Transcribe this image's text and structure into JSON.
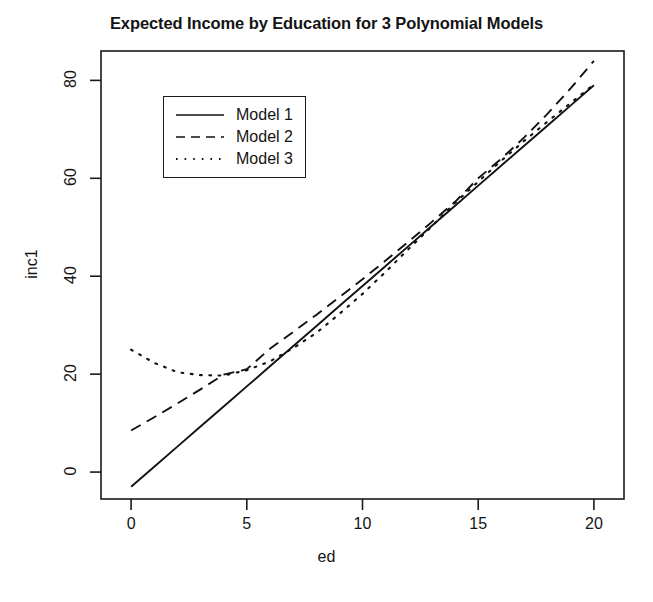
{
  "chart_data": {
    "type": "line",
    "title": "Expected Income by Education for 3 Polynomial Models",
    "xlabel": "ed",
    "ylabel": "inc1",
    "xlim": [
      -1.3,
      21.3
    ],
    "ylim": [
      -5.5,
      86.0
    ],
    "grid": false,
    "legend_position": "top-left-inside",
    "xticks": [
      0,
      5,
      10,
      15,
      20
    ],
    "xtick_labels": [
      "0",
      "5",
      "10",
      "15",
      "20"
    ],
    "yticks": [
      0,
      20,
      40,
      60,
      80
    ],
    "ytick_labels": [
      "0",
      "20",
      "40",
      "60",
      "80"
    ],
    "x": [
      0,
      1,
      2,
      3,
      4,
      5,
      6,
      7,
      8,
      9,
      10,
      11,
      12,
      13,
      14,
      15,
      16,
      17,
      18,
      19,
      20
    ],
    "series": [
      {
        "name": "Model 1",
        "linestyle": "solid",
        "color": "#111111",
        "values": [
          -3.0,
          1.1,
          5.2,
          9.3,
          13.4,
          17.5,
          21.6,
          25.7,
          29.8,
          33.9,
          38.0,
          42.1,
          46.2,
          50.3,
          54.4,
          58.5,
          62.6,
          66.7,
          70.8,
          74.9,
          79.0
        ]
      },
      {
        "name": "Model 2",
        "linestyle": "dashed",
        "color": "#111111",
        "values": [
          8.5,
          11.0,
          13.6,
          16.2,
          18.9,
          21.6,
          24.4,
          27.3,
          30.2,
          33.2,
          36.2,
          39.3,
          42.5,
          45.7,
          49.0,
          52.4,
          55.8,
          59.3,
          62.8,
          66.4,
          70.1
        ]
      },
      {
        "name": "Model 3",
        "linestyle": "dotted",
        "color": "#111111",
        "values": [
          25.0,
          22.3,
          20.4,
          19.8,
          19.7,
          20.8,
          22.6,
          25.3,
          28.4,
          32.3,
          36.4,
          40.9,
          45.6,
          50.2,
          55.0,
          59.3,
          63.6,
          67.7,
          71.6,
          75.4,
          79.2
        ]
      }
    ],
    "model2_quadratic_values": [
      8.5,
      11.2,
      14.0,
      16.9,
      19.9,
      21.0,
      25.2,
      28.6,
      32.1,
      35.7,
      39.4,
      43.2,
      47.1,
      51.1,
      55.2,
      60.0,
      64.0,
      68.4,
      73.2,
      78.4,
      84.0
    ]
  },
  "legend": {
    "entries": [
      {
        "label": "Model 1",
        "style": "solid"
      },
      {
        "label": "Model 2",
        "style": "dashed"
      },
      {
        "label": "Model 3",
        "style": "dotted"
      }
    ]
  }
}
